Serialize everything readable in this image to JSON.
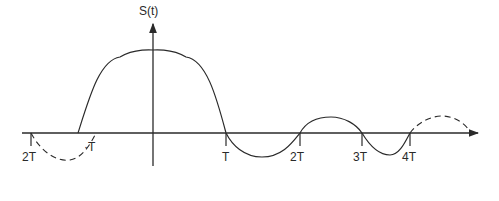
{
  "diagram": {
    "title": "",
    "y_axis_label": "S(t)",
    "x_ticks": [
      {
        "label": "2T",
        "x": 30
      },
      {
        "label": "·T",
        "x": 78
      },
      {
        "label": "T",
        "x": 226
      },
      {
        "label": "2T",
        "x": 300
      },
      {
        "label": "3T",
        "x": 362
      },
      {
        "label": "4T",
        "x": 410
      }
    ],
    "colors": {
      "stroke": "#2a2a2a",
      "background": "#ffffff"
    },
    "curve": {
      "solid_segment": "-T to 4T",
      "dashed_segments": [
        "-2T to -T",
        "4T to 5T"
      ],
      "description": "sinc-like pulse centered at t=0 with zero crossings at multiples of T"
    }
  }
}
